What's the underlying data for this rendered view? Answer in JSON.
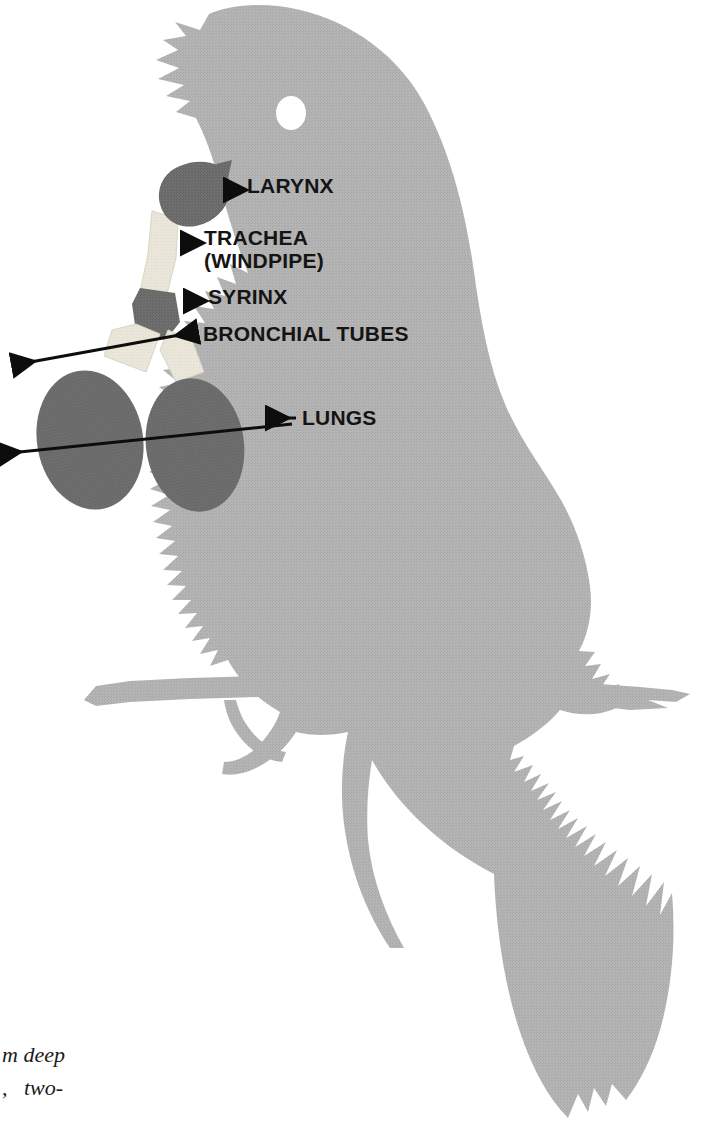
{
  "figure": {
    "colors": {
      "background": "#ffffff",
      "body_gray": "#b2b2b2",
      "organ_dark": "#6d6d6d",
      "tube_light": "#eae6d9",
      "label_text": "#141414",
      "arrow": "#0d0d0d",
      "eye_white": "#ffffff"
    }
  },
  "labels": [
    {
      "id": "larynx",
      "text": "LARYNX",
      "x": 247,
      "y": 183,
      "arrow": "left",
      "organ": "larynx-shape"
    },
    {
      "id": "trachea",
      "text": "TRACHEA",
      "line2": "(WINDPIPE)",
      "x": 204,
      "y": 235,
      "arrow": "left",
      "organ": "trachea-shape"
    },
    {
      "id": "syrinx",
      "text": "SYRINX",
      "x": 208,
      "y": 294,
      "arrow": "left",
      "organ": "syrinx-shape"
    },
    {
      "id": "bronchial_tubes",
      "text": "BRONCHIAL TUBES",
      "x": 203,
      "y": 330,
      "arrow": "diagonal-down-left",
      "organ": "bronchial-tubes-shape"
    },
    {
      "id": "lungs",
      "text": "LUNGS",
      "x": 300,
      "y": 410,
      "arrow": "left-double",
      "organ": "lungs-shape"
    }
  ],
  "organs": [
    {
      "id": "larynx",
      "name": "larynx",
      "shade": "dark"
    },
    {
      "id": "trachea",
      "name": "trachea-windpipe",
      "shade": "light"
    },
    {
      "id": "syrinx",
      "name": "syrinx",
      "shade": "dark"
    },
    {
      "id": "bronchial-left",
      "name": "bronchial-tube-left",
      "shade": "light"
    },
    {
      "id": "bronchial-right",
      "name": "bronchial-tube-right",
      "shade": "light"
    },
    {
      "id": "lung-left",
      "name": "lung-left",
      "shade": "dark"
    },
    {
      "id": "lung-right",
      "name": "lung-right",
      "shade": "dark"
    }
  ],
  "caption": {
    "line1": "m deep",
    "line2": ",   two-",
    "x": 2,
    "y": 1042
  }
}
